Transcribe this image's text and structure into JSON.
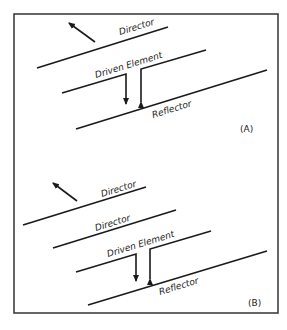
{
  "diagram": {
    "type": "yagi-antenna-elements",
    "panels": [
      {
        "id": "A",
        "tag": "(A)",
        "elements": [
          {
            "role": "director",
            "label": "Director"
          },
          {
            "role": "driven",
            "label": "Driven Element"
          },
          {
            "role": "reflector",
            "label": "Reflector"
          }
        ],
        "direction_arrow": "toward-director"
      },
      {
        "id": "B",
        "tag": "(B)",
        "elements": [
          {
            "role": "director",
            "label": "Director"
          },
          {
            "role": "director",
            "label": "Director"
          },
          {
            "role": "driven",
            "label": "Driven Element"
          },
          {
            "role": "reflector",
            "label": "Reflector"
          }
        ],
        "direction_arrow": "toward-director"
      }
    ],
    "colors": {
      "line": "#1a1a1a",
      "border": "#333333",
      "background": "#ffffff"
    }
  }
}
